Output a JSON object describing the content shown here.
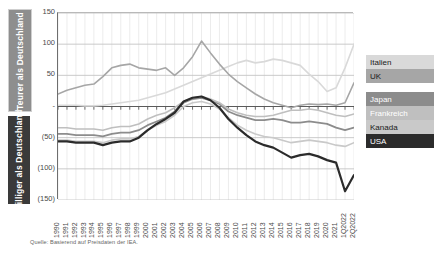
{
  "side_labels": {
    "upper": "Teurer als Deutschland",
    "lower": "Billiger als Deutschland",
    "upper_color": "#8e8e8e",
    "lower_color": "#3a3a3a"
  },
  "source_note": "Quelle: Basierend auf Preisdaten der IEA.",
  "legend": [
    {
      "label": "Italien",
      "color": "#d9d9d9",
      "text_color": "#1a1a1a"
    },
    {
      "label": "UK",
      "color": "#a6a6a6",
      "text_color": "#1a1a1a"
    },
    {
      "label": "Japan",
      "color": "#8c8c8c",
      "text_color": "#ffffff"
    },
    {
      "label": "Frankreich",
      "color": "#bfbfbf",
      "text_color": "#ffffff"
    },
    {
      "label": "Kanada",
      "color": "#c9c9c9",
      "text_color": "#1a1a1a"
    },
    {
      "label": "USA",
      "color": "#2b2b2b",
      "text_color": "#ffffff"
    }
  ],
  "chart_data": {
    "type": "line",
    "title": "",
    "subtitle": "",
    "xlabel": "",
    "ylabel": "",
    "ylim": [
      -150,
      150
    ],
    "grid": true,
    "legend_position": "right",
    "ytick_labels": [
      "150",
      "100",
      "50",
      "-",
      "(50)",
      "(100)",
      "(150)"
    ],
    "ytick_values": [
      150,
      100,
      50,
      0,
      -50,
      -100,
      -150
    ],
    "categories": [
      "1990",
      "1991",
      "1992",
      "1993",
      "1994",
      "1995",
      "1996",
      "1997",
      "1998",
      "1999",
      "2000",
      "2001",
      "2002",
      "2003",
      "2004",
      "2005",
      "2006",
      "2007",
      "2008",
      "2009",
      "2010",
      "2011",
      "2012",
      "2013",
      "2014",
      "2015",
      "2016",
      "2017",
      "2018",
      "2019",
      "2020",
      "2021",
      "1Q2022",
      "2Q2022"
    ],
    "series": [
      {
        "name": "Italien",
        "color": "#d9d9d9",
        "width": 1.6,
        "values": [
          2,
          2,
          2,
          1,
          1,
          2,
          4,
          6,
          8,
          10,
          14,
          18,
          22,
          28,
          34,
          40,
          46,
          52,
          58,
          64,
          70,
          74,
          70,
          72,
          76,
          74,
          70,
          66,
          52,
          40,
          24,
          30,
          62,
          100
        ]
      },
      {
        "name": "UK",
        "color": "#a6a6a6",
        "width": 1.6,
        "values": [
          20,
          26,
          30,
          34,
          36,
          48,
          62,
          66,
          68,
          62,
          60,
          58,
          62,
          50,
          62,
          80,
          105,
          86,
          68,
          52,
          40,
          30,
          20,
          12,
          6,
          2,
          -2,
          2,
          4,
          3,
          4,
          2,
          6,
          38
        ]
      },
      {
        "name": "Japan",
        "color": "#8c8c8c",
        "width": 1.8,
        "values": [
          -44,
          -44,
          -46,
          -46,
          -46,
          -48,
          -44,
          -42,
          -42,
          -38,
          -30,
          -24,
          -18,
          -8,
          6,
          12,
          14,
          10,
          4,
          -8,
          -14,
          -18,
          -22,
          -22,
          -20,
          -22,
          -26,
          -26,
          -24,
          -26,
          -28,
          -34,
          -38,
          -34
        ]
      },
      {
        "name": "Frankreich",
        "color": "#bfbfbf",
        "width": 1.6,
        "values": [
          -34,
          -34,
          -36,
          -36,
          -36,
          -38,
          -34,
          -32,
          -32,
          -28,
          -20,
          -14,
          -10,
          -2,
          8,
          14,
          16,
          12,
          6,
          -4,
          -10,
          -14,
          -16,
          -16,
          -14,
          -10,
          -6,
          -6,
          -4,
          -6,
          -10,
          -14,
          -16,
          -12
        ]
      },
      {
        "name": "Kanada",
        "color": "#c9c9c9",
        "width": 1.6,
        "values": [
          -54,
          -54,
          -56,
          -56,
          -56,
          -58,
          -54,
          -52,
          -52,
          -48,
          -38,
          -30,
          -24,
          -14,
          0,
          6,
          8,
          4,
          -4,
          -18,
          -30,
          -38,
          -44,
          -48,
          -50,
          -54,
          -58,
          -56,
          -54,
          -56,
          -58,
          -62,
          -64,
          -58
        ]
      },
      {
        "name": "USA",
        "color": "#2b2b2b",
        "width": 2.2,
        "values": [
          -56,
          -56,
          -58,
          -58,
          -58,
          -62,
          -58,
          -56,
          -56,
          -50,
          -38,
          -28,
          -20,
          -10,
          8,
          14,
          16,
          10,
          -2,
          -20,
          -34,
          -46,
          -56,
          -62,
          -66,
          -74,
          -82,
          -78,
          -76,
          -80,
          -86,
          -90,
          -136,
          -110
        ]
      }
    ]
  }
}
